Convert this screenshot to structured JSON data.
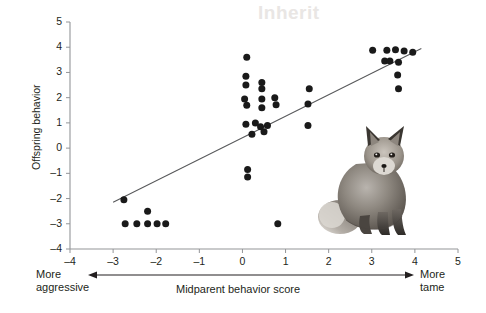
{
  "figure": {
    "y_axis_label": "Offspring behavior",
    "x_axis_label": "Midparent behavior score",
    "left_annotation_line1": "More",
    "left_annotation_line2": "aggressive",
    "right_annotation_line1": "More",
    "right_annotation_line2": "tame",
    "photo_subject": "fox-photograph",
    "bleed_through_text": "Inherit"
  },
  "colors": {
    "axis": "#939598",
    "point": "#1a1a1a",
    "regression_line": "#58595b",
    "text": "#231f20",
    "background": "#ffffff"
  },
  "chart_data": {
    "type": "scatter",
    "title": "",
    "xlabel": "Midparent behavior score",
    "ylabel": "Offspring behavior",
    "xlim": [
      -4,
      5
    ],
    "ylim": [
      -4,
      5
    ],
    "xticks": [
      -4,
      -3,
      -2,
      -1,
      0,
      1,
      2,
      3,
      4,
      5
    ],
    "yticks": [
      -4,
      -3,
      -2,
      -1,
      0,
      1,
      2,
      3,
      4,
      5
    ],
    "xticklabels": [
      "-4",
      "-3",
      "-2",
      "-1",
      "0",
      "1",
      "2",
      "3",
      "4",
      "5"
    ],
    "yticklabels": [
      "-4",
      "-3",
      "-2",
      "-1",
      "0",
      "1",
      "2",
      "3",
      "4",
      "5"
    ],
    "grid": false,
    "legend": null,
    "points": [
      [
        -2.75,
        -2.05
      ],
      [
        -2.72,
        -3.0
      ],
      [
        -2.45,
        -3.0
      ],
      [
        -2.2,
        -3.0
      ],
      [
        -2.2,
        -2.5
      ],
      [
        -1.98,
        -3.0
      ],
      [
        -1.78,
        -3.0
      ],
      [
        0.1,
        3.6
      ],
      [
        0.08,
        2.85
      ],
      [
        0.08,
        2.5
      ],
      [
        0.45,
        2.6
      ],
      [
        0.45,
        2.35
      ],
      [
        0.05,
        1.95
      ],
      [
        0.1,
        1.7
      ],
      [
        0.45,
        1.95
      ],
      [
        0.45,
        1.6
      ],
      [
        0.75,
        2.0
      ],
      [
        0.78,
        1.72
      ],
      [
        0.08,
        0.95
      ],
      [
        0.3,
        1.0
      ],
      [
        0.42,
        0.85
      ],
      [
        0.5,
        0.65
      ],
      [
        0.22,
        0.55
      ],
      [
        0.58,
        0.9
      ],
      [
        0.12,
        -0.85
      ],
      [
        0.12,
        -1.15
      ],
      [
        0.82,
        -3.0
      ],
      [
        1.55,
        2.35
      ],
      [
        1.52,
        1.75
      ],
      [
        1.52,
        0.9
      ],
      [
        3.02,
        3.88
      ],
      [
        3.35,
        3.88
      ],
      [
        3.55,
        3.9
      ],
      [
        3.75,
        3.85
      ],
      [
        3.95,
        3.8
      ],
      [
        3.3,
        3.45
      ],
      [
        3.42,
        3.45
      ],
      [
        3.62,
        3.4
      ],
      [
        3.6,
        2.9
      ],
      [
        3.62,
        2.35
      ]
    ],
    "regression_line": {
      "x_start": -3.0,
      "y_start": -2.15,
      "x_end": 4.15,
      "y_end": 3.95
    }
  }
}
